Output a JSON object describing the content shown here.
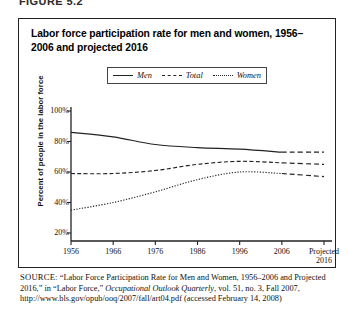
{
  "figure": {
    "label": "FIGURE 5.2",
    "title": "Labor force participation rate for men and women, 1956–2006 and projected 2016",
    "title_line1": "Labor force participation rate for men and women, 1956–2006",
    "title_line2": "and projected 2016"
  },
  "legend": {
    "items": [
      {
        "label": "Men",
        "style": "solid",
        "icon": "solid-line-icon"
      },
      {
        "label": "Total",
        "style": "dashed",
        "icon": "dashed-line-icon"
      },
      {
        "label": "Women",
        "style": "dotted",
        "icon": "dotted-line-icon"
      }
    ]
  },
  "axes": {
    "ylabel": "Percent of people in the labor force",
    "yticks": [
      "100%",
      "80%",
      "60%",
      "40%",
      "20%"
    ],
    "xticks": [
      "1956",
      "1966",
      "1976",
      "1986",
      "1996",
      "2006",
      "Projected 2016"
    ],
    "xtick_last_line1": "Projected",
    "xtick_last_line2": "2016"
  },
  "source": {
    "prefix": "SOURCE:",
    "text_1": " “Labor Force Participation Rate for Men and Women, 1956–2006 and Projected 2016,” in “Labor Force,” ",
    "italic_1": "Occupational Outlook Quarterly",
    "text_2": ", vol. 51, no. 3, Fall 2007, http://www.bls.gov/opub/ooq/2007/fall/art04.pdf (accessed February 14, 2008)"
  },
  "colors": {
    "line": "#222222",
    "border": "#222222",
    "background": "#ffffff",
    "text": "#111111"
  },
  "chart_data": {
    "type": "line",
    "title": "Labor force participation rate for men and women, 1956–2006 and projected 2016",
    "xlabel": "",
    "ylabel": "Percent of people in the labor force",
    "x": [
      "1956",
      "1966",
      "1976",
      "1986",
      "1996",
      "2006",
      "Projected 2016"
    ],
    "xlim": [
      0,
      6
    ],
    "ylim": [
      20,
      100
    ],
    "yticks": [
      20,
      40,
      60,
      80,
      100
    ],
    "ytick_suffix": "%",
    "grid": false,
    "legend_position": "top-center",
    "projection_from_index": 5,
    "series": [
      {
        "name": "Men",
        "style": "solid",
        "values": [
          86,
          83,
          78,
          76,
          75,
          73,
          73
        ]
      },
      {
        "name": "Total",
        "style": "dashed",
        "values": [
          59,
          59,
          61,
          65,
          67,
          66,
          65
        ]
      },
      {
        "name": "Women",
        "style": "dotted",
        "values": [
          35,
          40,
          47,
          55,
          60,
          59,
          57
        ]
      }
    ]
  }
}
